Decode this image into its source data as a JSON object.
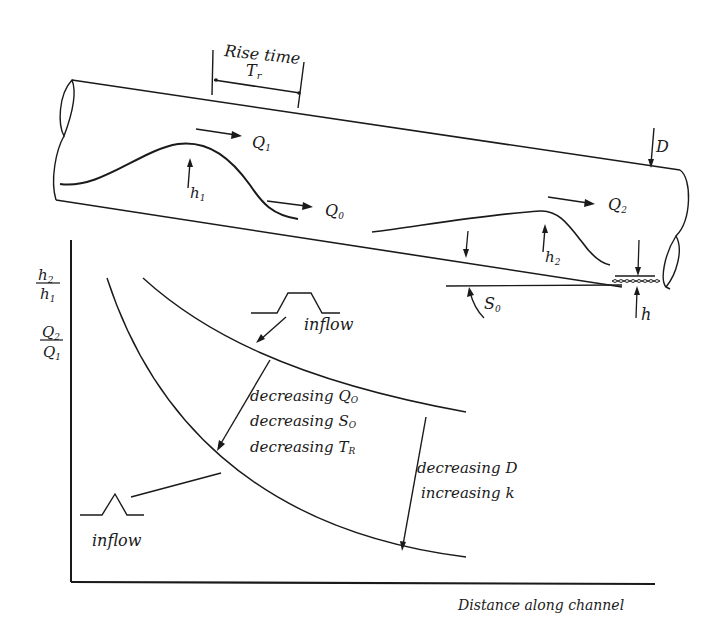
{
  "pipe_diagram": {
    "rise_time": {
      "line1": "Rise time",
      "line2": "T",
      "sub": "r"
    },
    "flows": [
      {
        "id": "q1",
        "label": "Q",
        "sub": "1"
      },
      {
        "id": "q0",
        "label": "Q",
        "sub": "0"
      },
      {
        "id": "q2",
        "label": "Q",
        "sub": "2"
      }
    ],
    "depths": [
      {
        "id": "h1",
        "label": "h",
        "sub": "1"
      },
      {
        "id": "h2",
        "label": "h",
        "sub": "2"
      },
      {
        "id": "h",
        "label": "h",
        "sub": ""
      }
    ],
    "diameter": {
      "label": "D"
    },
    "slope": {
      "label": "S",
      "sub": "0"
    }
  },
  "response_plot": {
    "y_axis": {
      "ratio1": {
        "num": "h",
        "num_sub": "2",
        "den": "h",
        "den_sub": "1"
      },
      "ratio2": {
        "num": "Q",
        "num_sub": "2",
        "den": "Q",
        "den_sub": "1"
      }
    },
    "x_axis_label": "Distance along channel",
    "inflow_wide_label": "inflow",
    "inflow_narrow_label": "inflow",
    "annotation_left": [
      {
        "text": "decreasing Q",
        "sub": "O"
      },
      {
        "text": "decreasing S",
        "sub": "O"
      },
      {
        "text": "decreasing T",
        "sub": "R"
      }
    ],
    "annotation_right": [
      {
        "text": "decreasing D"
      },
      {
        "text": "increasing k"
      }
    ]
  }
}
